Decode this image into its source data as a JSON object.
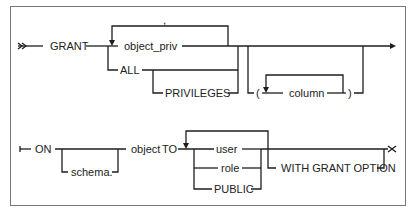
{
  "diagram": {
    "type": "syntax-railroad",
    "statement": "GRANT",
    "row1": {
      "keyword": "GRANT",
      "privileges": {
        "loop_separator": ",",
        "object_priv": "object_priv",
        "all": "ALL",
        "privileges_opt": "PRIVILEGES"
      },
      "column_list": {
        "open_paren": "(",
        "column": "column",
        "close_paren": ")"
      }
    },
    "row2": {
      "keyword_on": "ON",
      "schema_opt": "schema.",
      "object": "object",
      "keyword_to": "TO",
      "grantees": [
        "user",
        "role",
        "PUBLIC"
      ],
      "with_grant_option": "WITH GRANT OPTION"
    }
  }
}
